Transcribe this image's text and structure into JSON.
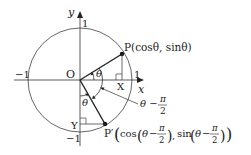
{
  "diagram": {
    "axes": {
      "x_label": "x",
      "y_label": "y",
      "origin_label": "O",
      "tick_pos_x": "1",
      "tick_neg_x": "−1",
      "tick_pos_y": "1",
      "tick_neg_y": "−1"
    },
    "points": {
      "P": {
        "label": "P(cosθ, sinθ)",
        "name": "P"
      },
      "P_prime": {
        "label_prefix": "P′",
        "label_body": "(cos(θ − π/2), sin(θ − π/2))"
      },
      "X": {
        "label": "X"
      },
      "Y": {
        "label": "Y"
      }
    },
    "angles": {
      "theta": "θ",
      "theta_small": "θ",
      "rotation_label_theta": "θ −",
      "rotation_label_pi": "π",
      "rotation_label_den": "2"
    },
    "p_prime_coords": {
      "cos": "cos",
      "sin": "sin",
      "theta": "θ",
      "minus": "−",
      "pi": "π",
      "two": "2",
      "comma": ","
    },
    "colors": {
      "stroke": "#333333",
      "text": "#222222",
      "background": "#ffffff"
    }
  }
}
